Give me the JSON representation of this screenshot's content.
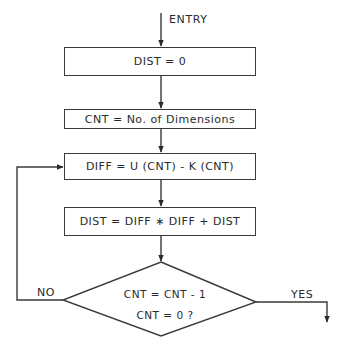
{
  "flowchart": {
    "entry_label": "ENTRY",
    "steps": [
      {
        "id": "init-dist",
        "text": "DIST = 0"
      },
      {
        "id": "init-cnt",
        "text": "CNT = No. of Dimensions"
      },
      {
        "id": "compute-diff",
        "text": "DIFF = U (CNT) - K (CNT)"
      },
      {
        "id": "accumulate-dist",
        "text": "DIST = DIFF ∗ DIFF + DIST"
      }
    ],
    "decision": {
      "line1": "CNT = CNT - 1",
      "line2": "CNT = 0 ?",
      "no_label": "NO",
      "yes_label": "YES"
    }
  }
}
